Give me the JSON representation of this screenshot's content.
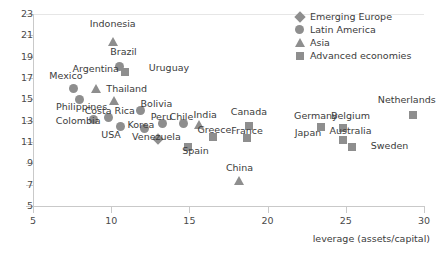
{
  "chart_data": {
    "type": "scatter",
    "title": "",
    "xlabel": "leverage (assets/capital)",
    "ylabel": "",
    "xlim": [
      5,
      30
    ],
    "ylim": [
      5,
      23
    ],
    "xticks": [
      5,
      10,
      15,
      20,
      25,
      30
    ],
    "yticks": [
      5,
      7,
      9,
      11,
      13,
      15,
      17,
      19,
      21,
      23
    ],
    "grid": false,
    "legend_position": "top-right",
    "marker_color": "#8e8e8e",
    "legend": [
      {
        "name": "Emerging Europe",
        "marker": "diamond"
      },
      {
        "name": "Latin America",
        "marker": "circle"
      },
      {
        "name": "Asia",
        "marker": "triangle"
      },
      {
        "name": "Advanced economies",
        "marker": "square"
      }
    ],
    "points": [
      {
        "label": "Indonesia",
        "x": 10.1,
        "y": 20.4,
        "series": "Asia",
        "marker": "triangle",
        "lx": 10.1,
        "ly": 22.1,
        "anchor": "center"
      },
      {
        "label": "Brazil",
        "x": 10.5,
        "y": 18.1,
        "series": "Latin America",
        "marker": "circle",
        "lx": 10.8,
        "ly": 19.4,
        "anchor": "center"
      },
      {
        "label": "Uruguay",
        "x": 10.9,
        "y": 17.6,
        "series": "Latin America",
        "marker": "square",
        "lx": 12.4,
        "ly": 17.9,
        "anchor": "start"
      },
      {
        "label": "Argentina",
        "x": 9.0,
        "y": 16.0,
        "series": "Latin America",
        "marker": "triangle",
        "lx": 9.0,
        "ly": 17.8,
        "anchor": "center"
      },
      {
        "label": "Mexico",
        "x": 7.6,
        "y": 16.0,
        "series": "Latin America",
        "marker": "circle",
        "lx": 7.1,
        "ly": 17.2,
        "anchor": "center"
      },
      {
        "label": "Thailand",
        "x": 10.2,
        "y": 14.8,
        "series": "Asia",
        "marker": "triangle",
        "lx": 11.0,
        "ly": 16.0,
        "anchor": "center"
      },
      {
        "label": "Philippines",
        "x": 8.0,
        "y": 15.0,
        "series": "Asia",
        "marker": "circle",
        "lx": 8.1,
        "ly": 14.3,
        "anchor": "center"
      },
      {
        "label": "Bolivia",
        "x": 11.9,
        "y": 14.0,
        "series": "Latin America",
        "marker": "circle",
        "lx": 12.9,
        "ly": 14.6,
        "anchor": "center"
      },
      {
        "label": "Costa Rica",
        "x": 9.8,
        "y": 13.3,
        "series": "Latin America",
        "marker": "circle",
        "lx": 9.9,
        "ly": 13.9,
        "anchor": "center"
      },
      {
        "label": "Colombia",
        "x": 8.9,
        "y": 13.1,
        "series": "Latin America",
        "marker": "circle",
        "lx": 7.9,
        "ly": 13.0,
        "anchor": "center"
      },
      {
        "label": "USA",
        "x": 10.6,
        "y": 12.5,
        "series": "Advanced economies",
        "marker": "circle",
        "lx": 10.0,
        "ly": 11.7,
        "anchor": "center"
      },
      {
        "label": "Korea",
        "x": 12.1,
        "y": 12.3,
        "series": "Asia",
        "marker": "circle",
        "lx": 11.9,
        "ly": 12.6,
        "anchor": "center"
      },
      {
        "label": "Peru",
        "x": 13.3,
        "y": 12.7,
        "series": "Latin America",
        "marker": "circle",
        "lx": 13.2,
        "ly": 13.3,
        "anchor": "center"
      },
      {
        "label": "Chile",
        "x": 14.6,
        "y": 12.7,
        "series": "Latin America",
        "marker": "circle",
        "lx": 14.5,
        "ly": 13.3,
        "anchor": "center"
      },
      {
        "label": "India",
        "x": 15.6,
        "y": 12.6,
        "series": "Asia",
        "marker": "triangle",
        "lx": 16.0,
        "ly": 13.5,
        "anchor": "center"
      },
      {
        "label": "Venezuela",
        "x": 13.0,
        "y": 11.3,
        "series": "Latin America",
        "marker": "diamond",
        "lx": 12.9,
        "ly": 11.5,
        "anchor": "center"
      },
      {
        "label": "Spain",
        "x": 14.9,
        "y": 10.5,
        "series": "Advanced economies",
        "marker": "square",
        "lx": 15.4,
        "ly": 10.2,
        "anchor": "center"
      },
      {
        "label": "Greece",
        "x": 16.5,
        "y": 11.5,
        "series": "Advanced economies",
        "marker": "square",
        "lx": 16.6,
        "ly": 12.1,
        "anchor": "center"
      },
      {
        "label": "Canada",
        "x": 18.8,
        "y": 12.5,
        "series": "Advanced economies",
        "marker": "square",
        "lx": 18.8,
        "ly": 13.8,
        "anchor": "center"
      },
      {
        "label": "France",
        "x": 18.7,
        "y": 11.4,
        "series": "Advanced economies",
        "marker": "square",
        "lx": 18.7,
        "ly": 12.0,
        "anchor": "center"
      },
      {
        "label": "China",
        "x": 18.2,
        "y": 7.3,
        "series": "Asia",
        "marker": "triangle",
        "lx": 18.2,
        "ly": 8.6,
        "anchor": "center"
      },
      {
        "label": "Japan",
        "x": 23.4,
        "y": 12.4,
        "series": "Advanced economies",
        "marker": "square",
        "lx": 22.6,
        "ly": 11.8,
        "anchor": "center"
      },
      {
        "label": "Germany",
        "x": 23.4,
        "y": 12.4,
        "series": "Advanced economies",
        "marker": "square",
        "lx": 23.1,
        "ly": 13.4,
        "anchor": "center"
      },
      {
        "label": "Belgium",
        "x": 24.8,
        "y": 12.3,
        "series": "Advanced economies",
        "marker": "square",
        "lx": 25.3,
        "ly": 13.4,
        "anchor": "center"
      },
      {
        "label": "Australia",
        "x": 24.8,
        "y": 11.2,
        "series": "Advanced economies",
        "marker": "square",
        "lx": 25.3,
        "ly": 12.0,
        "anchor": "center"
      },
      {
        "label": "Sweden",
        "x": 25.4,
        "y": 10.5,
        "series": "Advanced economies",
        "marker": "square",
        "lx": 26.6,
        "ly": 10.6,
        "anchor": "start"
      },
      {
        "label": "Netherlands",
        "x": 29.3,
        "y": 13.5,
        "series": "Advanced economies",
        "marker": "square",
        "lx": 28.9,
        "ly": 14.9,
        "anchor": "center"
      }
    ]
  },
  "top_cropped_text": " "
}
